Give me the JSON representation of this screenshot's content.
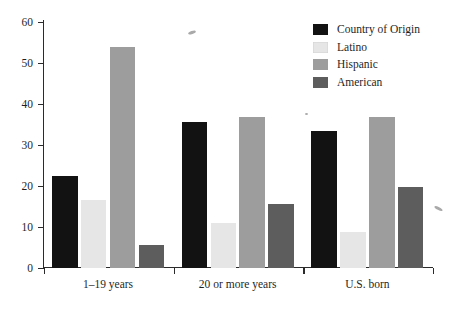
{
  "chart_data": {
    "type": "bar",
    "title": "",
    "subtitle": "",
    "xlabel": "",
    "ylabel": "",
    "ylim": [
      0,
      60
    ],
    "yticks": [
      0,
      10,
      20,
      30,
      40,
      50,
      60
    ],
    "grid": false,
    "legend_position": "top-right",
    "categories": [
      "1–19 years",
      "20 or more years",
      "U.S. born"
    ],
    "series": [
      {
        "name": "Country of Origin",
        "color": "#121212",
        "values": [
          22.5,
          35.5,
          33.5
        ]
      },
      {
        "name": "Latino",
        "color": "#e6e6e6",
        "values": [
          16.5,
          11.0,
          8.7
        ]
      },
      {
        "name": "Hispanic",
        "color": "#9d9d9d",
        "values": [
          54.0,
          36.8,
          36.8
        ]
      },
      {
        "name": "American",
        "color": "#5d5d5d",
        "values": [
          5.7,
          15.6,
          19.7
        ]
      }
    ]
  },
  "axis": {
    "y_tick_labels": [
      "0",
      "10",
      "20",
      "30",
      "40",
      "50",
      "60"
    ]
  },
  "legend": {
    "items": [
      {
        "label": "Country of Origin",
        "color": "#121212"
      },
      {
        "label": "Latino",
        "color": "#e6e6e6"
      },
      {
        "label": "Hispanic",
        "color": "#9d9d9d"
      },
      {
        "label": "American",
        "color": "#5d5d5d"
      }
    ]
  }
}
